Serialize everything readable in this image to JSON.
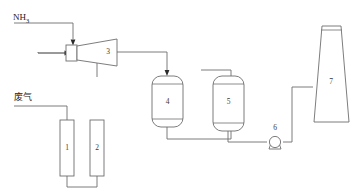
{
  "diagram": {
    "line_color": "#6e6e6e",
    "arrow_color": "#2b2b2b",
    "background": "#ffffff"
  },
  "streams": [
    {
      "id": "ammonia",
      "name": "ammonia-inlet-label",
      "text_main": "NH",
      "text_sub": "3"
    },
    {
      "id": "waste-gas",
      "name": "waste-gas-inlet-label",
      "text": "废气"
    }
  ],
  "equipment": [
    {
      "id": "col1",
      "label": "1",
      "name": "column-1"
    },
    {
      "id": "col2",
      "label": "2",
      "name": "column-2"
    },
    {
      "id": "venturi",
      "label": "3",
      "name": "venturi-diffuser-3"
    },
    {
      "id": "vessel4",
      "label": "4",
      "name": "vessel-4"
    },
    {
      "id": "vessel5",
      "label": "5",
      "name": "vessel-5"
    },
    {
      "id": "pump6",
      "label": "6",
      "name": "pump-6"
    },
    {
      "id": "stack7",
      "label": "7",
      "name": "stack-7"
    }
  ]
}
